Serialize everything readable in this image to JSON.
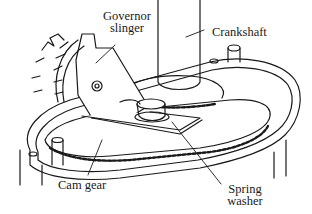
{
  "diagram": {
    "type": "mechanical-illustration",
    "line_color": "#1a1a1a",
    "background": "#ffffff",
    "labels": [
      {
        "id": "governor-slinger",
        "line1": "Governor",
        "line2": "slinger"
      },
      {
        "id": "crankshaft",
        "line1": "Crankshaft",
        "line2": ""
      },
      {
        "id": "cam-gear",
        "line1": "Cam gear",
        "line2": ""
      },
      {
        "id": "spring-washer",
        "line1": "Spring",
        "line2": "washer"
      }
    ]
  }
}
